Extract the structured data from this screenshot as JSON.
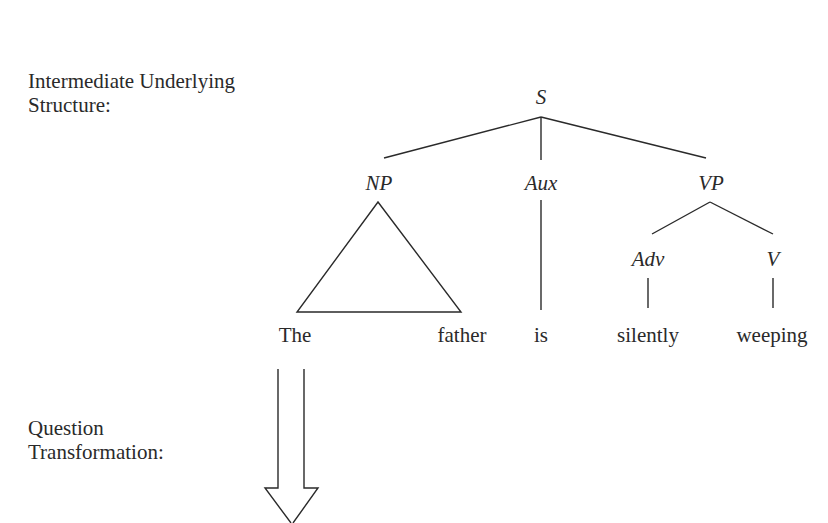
{
  "labels": {
    "underlying_line1": "Intermediate Underlying",
    "underlying_line2": "Structure:",
    "question_line1": "Question",
    "question_line2": "Transformation:"
  },
  "tree": {
    "root": "S",
    "nodes": {
      "np": "NP",
      "aux": "Aux",
      "vp": "VP",
      "adv": "Adv",
      "v": "V"
    },
    "words": {
      "the": "The",
      "father": "father",
      "is": "is",
      "silently": "silently",
      "weeping": "weeping"
    }
  },
  "colors": {
    "ink": "#2a2a2a",
    "background": "#ffffff"
  }
}
